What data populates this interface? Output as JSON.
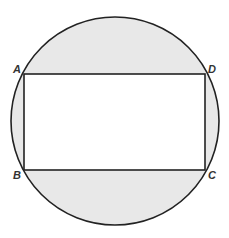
{
  "diagram": {
    "colors": {
      "shade": "#e8e8e8",
      "stroke": "#222222",
      "rect_fill": "#ffffff"
    },
    "circle": {
      "cx": 115,
      "cy": 121,
      "r": 104
    },
    "rectangle": {
      "x": 24,
      "y": 74,
      "width": 181,
      "height": 96
    },
    "labels": {
      "A": "A",
      "B": "B",
      "C": "C",
      "D": "D"
    }
  }
}
